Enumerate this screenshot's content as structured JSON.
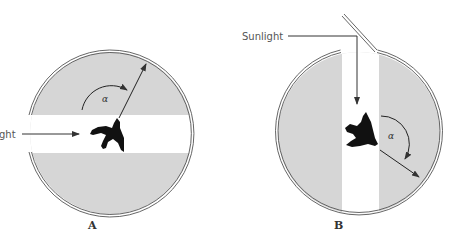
{
  "diagram": {
    "panels": [
      {
        "id": "A",
        "label": "A",
        "light_label": "Sunlight",
        "light_label_visible": "ght",
        "angle_symbol": "α",
        "light_direction": "horizontal from left",
        "colors": {
          "shade": "#d6d6d6",
          "outline": "#555555",
          "bird": "#111111"
        }
      },
      {
        "id": "B",
        "label": "B",
        "light_label": "Sunlight",
        "angle_symbol": "α",
        "light_direction": "vertical from top via mirror",
        "colors": {
          "shade": "#d6d6d6",
          "outline": "#555555",
          "bird": "#111111"
        }
      }
    ]
  }
}
